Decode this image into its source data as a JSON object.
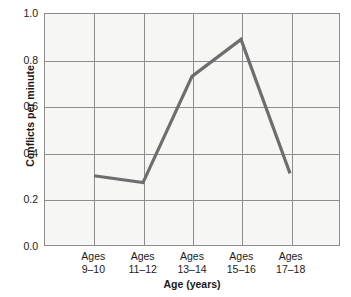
{
  "chart_data": {
    "type": "line",
    "title": "",
    "xlabel": "Age (years)",
    "ylabel": "Conflicts per minute",
    "categories": [
      "Ages 9–10",
      "Ages 11–12",
      "Ages 13–14",
      "Ages 15–16",
      "Ages 17–18"
    ],
    "category_lines": [
      {
        "line1": "Ages",
        "line2": "9–10"
      },
      {
        "line1": "Ages",
        "line2": "11–12"
      },
      {
        "line1": "Ages",
        "line2": "13–14"
      },
      {
        "line1": "Ages",
        "line2": "15–16"
      },
      {
        "line1": "Ages",
        "line2": "17–18"
      }
    ],
    "values": [
      0.3,
      0.27,
      0.73,
      0.89,
      0.31
    ],
    "ylim": [
      0.0,
      1.0
    ],
    "yticks": [
      0.0,
      0.2,
      0.4,
      0.6,
      0.8,
      1.0
    ],
    "ytick_labels": [
      "0.0",
      "0.2",
      "0.4",
      "0.6",
      "0.8",
      "1.0"
    ],
    "grid": true,
    "legend": false,
    "legend_position": "none",
    "series_color": "#6e6e6e",
    "grid_color": "#8d8d8d",
    "plot_background": "#f6f6f4",
    "text_color": "#1a1a1a"
  }
}
